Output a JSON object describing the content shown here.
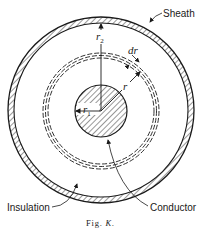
{
  "figure": {
    "caption_prefix": "Fig.",
    "caption_letter": "K.",
    "labels": {
      "sheath": "Sheath",
      "insulation": "Insulation",
      "conductor": "Conductor",
      "r2": "r",
      "r2_sub": "2",
      "r1": "r",
      "r1_sub": "1",
      "r": "r",
      "dr": "dr"
    },
    "colors": {
      "line": "#1a1a1a",
      "background": "#ffffff"
    }
  }
}
